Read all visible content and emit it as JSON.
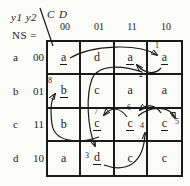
{
  "figure": {
    "corner_labels": {
      "present_state_vars": "y1 y2",
      "input_vars": "C D",
      "map_label": "NS ="
    },
    "column_headers": [
      "00",
      "01",
      "11",
      "10"
    ],
    "row_headers": [
      {
        "state": "a",
        "code": "00"
      },
      {
        "state": "b",
        "code": "01"
      },
      {
        "state": "c",
        "code": "11"
      },
      {
        "state": "d",
        "code": "10"
      }
    ],
    "cells": [
      [
        {
          "text": "a",
          "underlined": true
        },
        {
          "text": "d",
          "underlined": false
        },
        {
          "text": "a",
          "underlined": true
        },
        {
          "text": "a",
          "underlined": true
        }
      ],
      [
        {
          "text": "b",
          "underlined": true
        },
        {
          "text": "c",
          "underlined": false
        },
        {
          "text": "a",
          "underlined": false
        },
        {
          "text": "a",
          "underlined": false
        }
      ],
      [
        {
          "text": "b",
          "underlined": false
        },
        {
          "text": "c",
          "underlined": true
        },
        {
          "text": "c",
          "underlined": true
        },
        {
          "text": "c",
          "underlined": true
        }
      ],
      [
        {
          "text": "a",
          "underlined": false
        },
        {
          "text": "d",
          "underlined": true
        },
        {
          "text": "c",
          "underlined": false
        },
        {
          "text": "c",
          "underlined": false
        }
      ]
    ],
    "arrow_numbers": [
      "1",
      "2",
      "3",
      "4",
      "5",
      "6",
      "7",
      "8"
    ]
  }
}
